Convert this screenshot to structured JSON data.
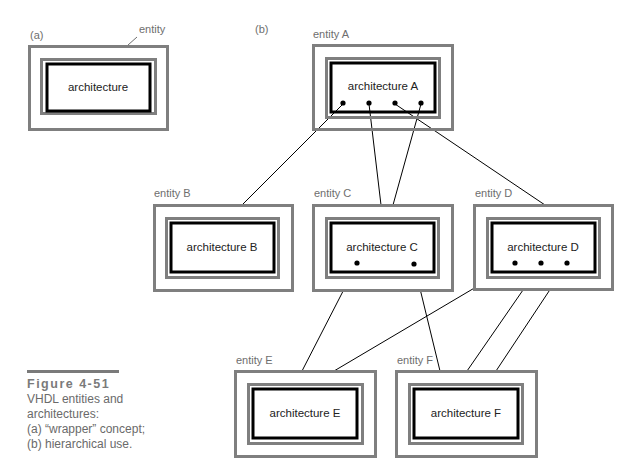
{
  "panels": {
    "a": {
      "label": "(a)",
      "entity_callout": "entity",
      "architecture": "architecture"
    },
    "b": {
      "label": "(b)"
    }
  },
  "entities": [
    {
      "id": "A",
      "entity_label": "entity A",
      "architecture_label": "architecture A"
    },
    {
      "id": "B",
      "entity_label": "entity B",
      "architecture_label": "architecture B"
    },
    {
      "id": "C",
      "entity_label": "entity C",
      "architecture_label": "architecture C"
    },
    {
      "id": "D",
      "entity_label": "entity D",
      "architecture_label": "architecture D"
    },
    {
      "id": "E",
      "entity_label": "entity E",
      "architecture_label": "architecture E"
    },
    {
      "id": "F",
      "entity_label": "entity F",
      "architecture_label": "architecture F"
    }
  ],
  "connections": [
    {
      "from": "A",
      "to": "B"
    },
    {
      "from": "A",
      "to": "C"
    },
    {
      "from": "A",
      "to": "C"
    },
    {
      "from": "A",
      "to": "D"
    },
    {
      "from": "C",
      "to": "E"
    },
    {
      "from": "D",
      "to": "E"
    },
    {
      "from": "C",
      "to": "F"
    },
    {
      "from": "D",
      "to": "F"
    },
    {
      "from": "D",
      "to": "F"
    }
  ],
  "caption": {
    "figure": "Figure 4-51",
    "lines": [
      "VHDL entities and",
      "architectures:",
      "(a) “wrapper” concept;",
      "(b) hierarchical use."
    ]
  },
  "colors": {
    "entity_frame": "#7f7f7f",
    "architecture_frame": "#000000",
    "label_text": "#6e6e6e"
  }
}
